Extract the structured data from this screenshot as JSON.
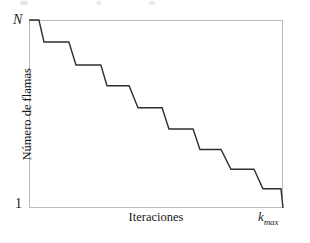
{
  "figure": {
    "name": "staircase-plot",
    "background_color": "#ffffff",
    "frame_color": "#b9b9b9",
    "line_color": "#2f2f2f",
    "line_width": 1.4,
    "text_color": "#1d1d1d"
  },
  "axes": {
    "y_tick_top": "N",
    "y_tick_bottom": "1",
    "x_tick_right_base": "k",
    "x_tick_right_sub": "max",
    "y_title": "Número de flamas",
    "x_title": "Iteraciones"
  },
  "chart_data": {
    "type": "line",
    "title": "",
    "xlabel": "Iteraciones",
    "ylabel": "Número de flamas",
    "xlim": [
      0,
      1
    ],
    "ylim": [
      1,
      10
    ],
    "xtick_labels": [
      "k_max"
    ],
    "xtick_values": [
      1
    ],
    "ytick_labels": [
      "1",
      "N"
    ],
    "ytick_values": [
      1,
      10
    ],
    "grid": false,
    "legend": null,
    "drawstyle": "steps-post-with-ramps",
    "series": [
      {
        "name": "numero de flamas",
        "color": "#2f2f2f",
        "x": [
          0.0,
          0.039,
          0.059,
          0.157,
          0.185,
          0.283,
          0.307,
          0.394,
          0.429,
          0.524,
          0.551,
          0.646,
          0.673,
          0.756,
          0.795,
          0.886,
          0.921,
          0.992,
          1.0
        ],
        "y": [
          10.0,
          10.0,
          8.95,
          8.95,
          7.85,
          7.85,
          6.85,
          6.85,
          5.8,
          5.8,
          4.78,
          4.78,
          3.8,
          3.8,
          2.85,
          2.85,
          1.92,
          1.92,
          1.0
        ],
        "points_normalized": [
          [
            0.0,
            1.0
          ],
          [
            0.039,
            1.0
          ],
          [
            0.059,
            0.883
          ],
          [
            0.157,
            0.883
          ],
          [
            0.185,
            0.761
          ],
          [
            0.283,
            0.761
          ],
          [
            0.307,
            0.65
          ],
          [
            0.394,
            0.65
          ],
          [
            0.429,
            0.533
          ],
          [
            0.524,
            0.533
          ],
          [
            0.551,
            0.42
          ],
          [
            0.646,
            0.42
          ],
          [
            0.673,
            0.311
          ],
          [
            0.756,
            0.311
          ],
          [
            0.795,
            0.206
          ],
          [
            0.886,
            0.206
          ],
          [
            0.921,
            0.102
          ],
          [
            0.992,
            0.102
          ],
          [
            1.0,
            0.0
          ]
        ],
        "step_count": 9
      }
    ]
  }
}
